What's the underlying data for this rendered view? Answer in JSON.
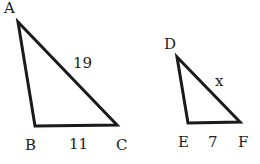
{
  "diagram": {
    "triangles": [
      {
        "name": "ABC",
        "vertices": {
          "A": "A",
          "B": "B",
          "C": "C"
        },
        "sides": {
          "AC": "19",
          "BC": "11"
        }
      },
      {
        "name": "DEF",
        "vertices": {
          "D": "D",
          "E": "E",
          "F": "F"
        },
        "sides": {
          "DF": "x",
          "EF": "7"
        }
      }
    ],
    "stroke_color": "#1a1a1a",
    "background": "#ffffff"
  }
}
